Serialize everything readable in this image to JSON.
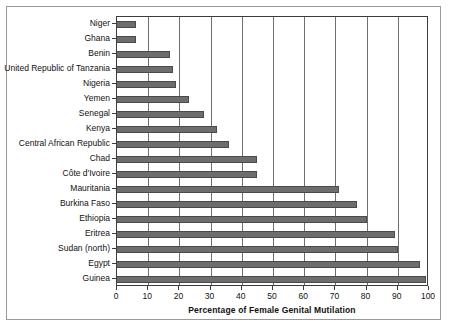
{
  "chart_data": {
    "type": "bar",
    "orientation": "horizontal",
    "title": "",
    "xlabel": "Percentage of Female Genital Mutilation",
    "ylabel": "",
    "xlim": [
      0,
      100
    ],
    "xticks": [
      0,
      10,
      20,
      30,
      40,
      50,
      60,
      70,
      80,
      90,
      100
    ],
    "grid": true,
    "grid_axis": "x",
    "legend": false,
    "bar_color": "#6d6d6d",
    "categories": [
      "Niger",
      "Ghana",
      "Benin",
      "United Republic of Tanzania",
      "Nigeria",
      "Yemen",
      "Senegal",
      "Kenya",
      "Central African Republic",
      "Chad",
      "Côte d'Ivoire",
      "Mauritania",
      "Burkina Faso",
      "Ethiopia",
      "Eritrea",
      "Sudan (north)",
      "Egypt",
      "Guinea"
    ],
    "values": [
      6,
      6,
      17,
      18,
      19,
      23,
      28,
      32,
      36,
      45,
      45,
      71,
      77,
      80,
      89,
      90,
      97,
      99
    ]
  }
}
